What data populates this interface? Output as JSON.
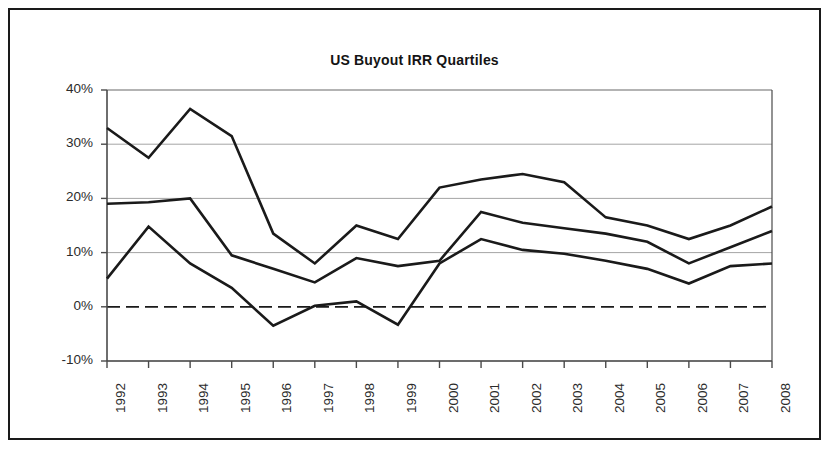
{
  "figure": {
    "title": "US Buyout IRR Quartiles",
    "border_color": "#1a1a1a",
    "background": "#ffffff"
  },
  "chart_data": {
    "type": "line",
    "title": "US Buyout IRR Quartiles",
    "xlabel": "",
    "ylabel": "",
    "categories": [
      "1992",
      "1993",
      "1994",
      "1995",
      "1996",
      "1997",
      "1998",
      "1999",
      "2000",
      "2001",
      "2002",
      "2003",
      "2004",
      "2005",
      "2006",
      "2007",
      "2008"
    ],
    "x": [
      1992,
      1993,
      1994,
      1995,
      1996,
      1997,
      1998,
      1999,
      2000,
      2001,
      2002,
      2003,
      2004,
      2005,
      2006,
      2007,
      2008
    ],
    "ylim": [
      -10,
      40
    ],
    "yticks": [
      -10,
      0,
      10,
      20,
      30,
      40
    ],
    "ytick_labels": [
      "-10%",
      "0%",
      "10%",
      "20%",
      "30%",
      "40%"
    ],
    "y_unit": "%",
    "grid": "horizontal",
    "zero_line": true,
    "zero_line_style": "dashed",
    "legend": "none",
    "series_color": "#1a1a1a",
    "series": [
      {
        "name": "Upper Quartile",
        "values": [
          33.0,
          27.5,
          36.5,
          31.5,
          13.5,
          8.0,
          15.0,
          12.5,
          22.0,
          23.5,
          24.5,
          23.0,
          16.5,
          15.0,
          12.5,
          15.0,
          18.5
        ]
      },
      {
        "name": "Median",
        "values": [
          19.0,
          19.3,
          20.0,
          9.5,
          7.0,
          4.5,
          9.0,
          7.5,
          8.5,
          17.5,
          15.5,
          14.5,
          13.5,
          12.0,
          8.0,
          11.0,
          14.0
        ]
      },
      {
        "name": "Lower Quartile",
        "values": [
          5.2,
          14.8,
          8.0,
          3.5,
          -3.5,
          0.2,
          1.0,
          -3.3,
          8.0,
          12.5,
          10.5,
          9.8,
          8.5,
          7.0,
          4.3,
          7.5,
          8.0
        ]
      }
    ]
  },
  "axes": {
    "ytick_labels": [
      "40%",
      "30%",
      "20%",
      "10%",
      "0%",
      "-10%"
    ],
    "xtick_labels": [
      "1992",
      "1993",
      "1994",
      "1995",
      "1996",
      "1997",
      "1998",
      "1999",
      "2000",
      "2001",
      "2002",
      "2003",
      "2004",
      "2005",
      "2006",
      "2007",
      "2008"
    ]
  }
}
